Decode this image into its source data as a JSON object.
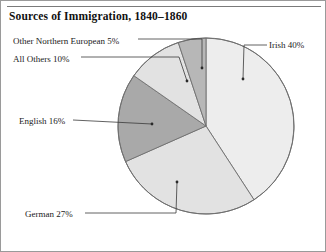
{
  "figure": {
    "title": "Sources of Immigration, 1840–1860"
  },
  "chart_data": {
    "type": "pie",
    "title": "Sources of Immigration, 1840–1860",
    "xlabel": "",
    "ylabel": "",
    "units": "percent",
    "legend_position": "callout-labels",
    "grid": false,
    "start_angle_deg": 0,
    "direction": "clockwise",
    "categories": [
      "Irish",
      "German",
      "English",
      "All Others",
      "Other Northern European"
    ],
    "values": [
      40,
      27,
      16,
      10,
      5
    ],
    "labels": [
      "Irish 40%",
      "German 27%",
      "English 16%",
      "All Others 10%",
      "Other Northern European 5%"
    ],
    "slices": [
      {
        "name": "Irish",
        "value": 40,
        "label": "Irish 40%",
        "color": "#ededed",
        "start_deg": 0.0,
        "end_deg": 144.0
      },
      {
        "name": "German",
        "value": 27,
        "label": "German 27%",
        "color": "#e2e2e2",
        "start_deg": 144.0,
        "end_deg": 241.2
      },
      {
        "name": "English",
        "value": 16,
        "label": "English 16%",
        "color": "#a9a9a9",
        "start_deg": 241.2,
        "end_deg": 298.8
      },
      {
        "name": "All Others",
        "value": 10,
        "label": "All Others 10%",
        "color": "#e2e2e2",
        "start_deg": 298.8,
        "end_deg": 334.8
      },
      {
        "name": "Other Northern European",
        "value": 5,
        "label": "Other Northern European 5%",
        "color": "#b7b7b7",
        "start_deg": 334.8,
        "end_deg": 360.0
      }
    ],
    "colors": {
      "irish": "#ededed",
      "german": "#e2e2e2",
      "english": "#a9a9a9",
      "all_others": "#e2e2e2",
      "other_northern_european": "#b7b7b7",
      "outline": "#6f6f6f",
      "leader_line": "#3a3a3a",
      "page_border": "#9a9a9a"
    }
  }
}
